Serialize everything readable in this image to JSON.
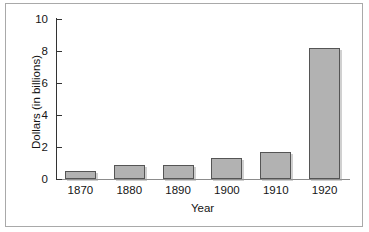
{
  "chart_data": {
    "type": "bar",
    "title": "",
    "xlabel": "Year",
    "ylabel": "Dollars (in billions)",
    "categories": [
      "1870",
      "1880",
      "1890",
      "1900",
      "1910",
      "1920"
    ],
    "values": [
      0.5,
      0.9,
      0.85,
      1.3,
      1.7,
      8.2
    ],
    "ylim": [
      0,
      10
    ],
    "yticks": [
      "0",
      "2",
      "4",
      "6",
      "8",
      "10"
    ],
    "ytick_values": [
      0,
      2,
      4,
      6,
      8,
      10
    ],
    "grid": false,
    "legend": null,
    "bar_color": "#b2b2b2",
    "bar_border_color": "#555555",
    "frame_color": "#a9a9a9",
    "axis_color": "#333333",
    "text_color": "#151515"
  }
}
